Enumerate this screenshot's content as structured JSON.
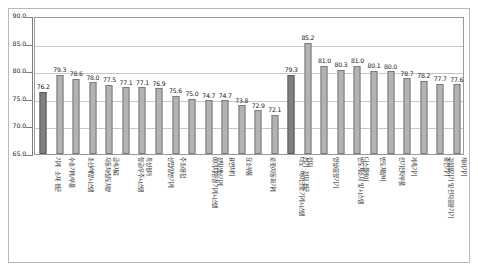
{
  "chart_data": {
    "type": "bar",
    "title": "",
    "subtitle": "",
    "xlabel": "",
    "ylabel": "",
    "ylim": [
      65.0,
      90.0
    ],
    "ytick_labels": [
      "90.0",
      "85.0",
      "80.0",
      "75.0",
      "70.0",
      "65.0"
    ],
    "yticks": [
      90.0,
      85.0,
      80.0,
      75.0,
      70.0,
      65.0
    ],
    "grid": true,
    "legend": false,
    "legend_position": "none",
    "categories": [
      "기계 · 소재 평균",
      "수송기계/부품",
      "조선/해양시스템",
      "자동차/철도차량",
      "금속재료",
      "항공/우주시스템",
      "특성평가",
      "산업/일반기계",
      "주조/용접",
      "에너지/환경 기계시스템",
      "정밀생산기계",
      "표면처리",
      "요소부품",
      "로봇/자동화기계",
      "나노 · 마이크로 기계시스템",
      "전기 · 전자 평균",
      "전자",
      "영상/음향기기",
      "반도체소자 및 시스템",
      "디스플레이",
      "반도체장비",
      "전기전자부품",
      "계측기기",
      "가정용기기 및 전자응용기기",
      "충전기기",
      "제어기기"
    ],
    "values": [
      76.2,
      79.3,
      78.6,
      78.0,
      77.5,
      77.1,
      77.1,
      76.9,
      75.6,
      75.0,
      74.7,
      74.7,
      73.8,
      72.9,
      72.1,
      79.3,
      85.2,
      81.0,
      80.3,
      81.0,
      80.1,
      80.0,
      78.7,
      78.2,
      77.7,
      77.6
    ],
    "value_labels": [
      "76.2",
      "79.3",
      "78.6",
      "78.0",
      "77.5",
      "77.1",
      "77.1",
      "76.9",
      "75.6",
      "75.0",
      "74.7",
      "74.7",
      "73.8",
      "72.9",
      "72.1",
      "79.3",
      "85.2",
      "81.0",
      "80.3",
      "81.0",
      "80.1",
      "80.0",
      "78.7",
      "78.2",
      "77.7",
      "77.6"
    ],
    "highlighted_indices": [
      0,
      15
    ],
    "colors": {
      "bar": "#b3b3b3",
      "bar_highlight": "#808080",
      "bar_border": "#7a7a7a",
      "grid": "#c8c8c8",
      "axis": "#7d7d7d",
      "plot_border": "#9a9a9a",
      "figure_border": "#b9b9b9",
      "text": "#141414",
      "background": "#ffffff"
    }
  }
}
